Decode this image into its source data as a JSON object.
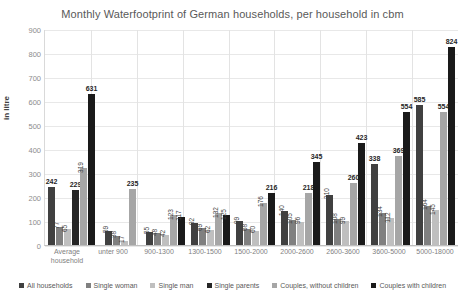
{
  "chart_data": {
    "type": "bar",
    "title": "Monthly Waterfootprint of German households, per household in cbm",
    "xlabel": "",
    "ylabel": "in litre",
    "ylim": [
      0,
      900
    ],
    "ytick_step": 100,
    "yticks": [
      "900",
      "800",
      "700",
      "600",
      "500",
      "400",
      "300",
      "200",
      "100",
      "0"
    ],
    "grid": true,
    "legend_position": "bottom",
    "categories": [
      "Average household",
      "unter 900",
      "900-1300",
      "1300-1500",
      "1500-2000",
      "2000-2600",
      "2600-3600",
      "3600-5000",
      "5000-18000"
    ],
    "series": [
      {
        "name": "All households",
        "color": "#404040",
        "values": [
          242,
          59,
          55,
          92,
          99,
          140,
          210,
          338,
          585
        ],
        "labels": [
          "242",
          "59",
          "55",
          "92",
          "99",
          "140",
          "210",
          "338",
          "585"
        ]
      },
      {
        "name": "Single woman",
        "color": "#808080",
        "values": [
          77,
          38,
          48,
          69,
          68,
          105,
          108,
          134,
          164
        ],
        "labels": [
          "77",
          "38",
          "48",
          "69",
          "68",
          "105",
          "108",
          "134",
          "164"
        ]
      },
      {
        "name": "Single man",
        "color": "#bfbfbf",
        "values": [
          65,
          17,
          42,
          62,
          60,
          96,
          99,
          112,
          145
        ],
        "labels": [
          "65",
          "17",
          "42",
          "62",
          "60",
          "96",
          "99",
          "112",
          "145"
        ]
      },
      {
        "name": "Single parents",
        "color": "#262626",
        "values": [
          229,
          0,
          0,
          0,
          0,
          0,
          0,
          0,
          0
        ],
        "labels": [
          "229",
          "",
          "",
          "",
          "",
          "",
          "",
          "",
          ""
        ]
      },
      {
        "name": "Couples, without children",
        "color": "#a6a6a6",
        "values": [
          319,
          235,
          123,
          132,
          176,
          218,
          260,
          369,
          554
        ],
        "labels": [
          "319",
          "235",
          "123",
          "132",
          "176",
          "218",
          "260",
          "369",
          "554"
        ]
      },
      {
        "name": "Couples with children",
        "color": "#1a1a1a",
        "values": [
          631,
          0,
          117,
          125,
          216,
          345,
          423,
          554,
          824
        ],
        "labels": [
          "631",
          "",
          "117",
          "125",
          "216",
          "345",
          "423",
          "554",
          "824"
        ]
      }
    ],
    "emphasized_labels": [
      "631",
      "235",
      "123",
      "132",
      "216",
      "345",
      "423",
      "554",
      "824",
      "369",
      "338",
      "585",
      "229",
      "242",
      "176",
      "218",
      "260"
    ]
  }
}
